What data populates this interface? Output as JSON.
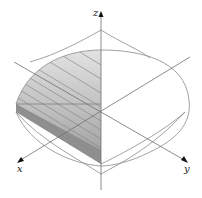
{
  "diagram": {
    "type": "3d-solid-cross-section",
    "axes": {
      "x": {
        "label": "x"
      },
      "y": {
        "label": "y"
      },
      "z": {
        "label": "z"
      }
    },
    "colors": {
      "background": "#ffffff",
      "outline": "#8a8a8a",
      "axis": "#6e6e6e",
      "shade_light": "#d9d9d9",
      "shade_mid": "#b5b5b5",
      "shade_dark": "#8c8c8c",
      "slice_lines": "#7a7a7a",
      "arrow": "#111111"
    }
  }
}
